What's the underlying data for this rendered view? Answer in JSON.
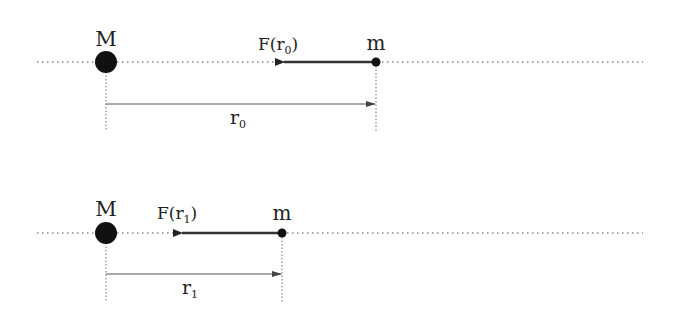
{
  "colors": {
    "ink": "#111111",
    "dotted": "#777777",
    "line": "#555555",
    "background": "#ffffff"
  },
  "panels": [
    {
      "id": "panel-r0",
      "big_mass_label": "M",
      "small_mass_label": "m",
      "force_label_main": "F(r",
      "force_label_sub": "0",
      "force_label_close": ")",
      "distance_label_main": "r",
      "distance_label_sub": "0"
    },
    {
      "id": "panel-r1",
      "big_mass_label": "M",
      "small_mass_label": "m",
      "force_label_main": "F(r",
      "force_label_sub": "1",
      "force_label_close": ")",
      "distance_label_main": "r",
      "distance_label_sub": "1"
    }
  ]
}
